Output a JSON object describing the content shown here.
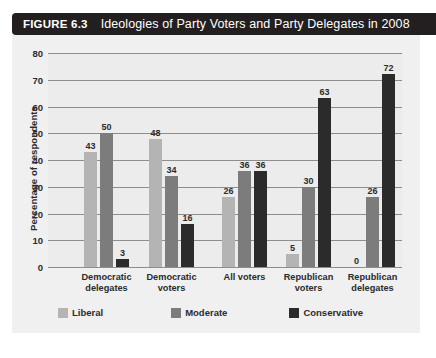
{
  "figure": {
    "number_label": "FIGURE 6.3",
    "title": "Ideologies of Party Voters and Party Delegates in 2008"
  },
  "colors": {
    "liberal": "#b4b4b4",
    "moderate": "#7c7c7c",
    "conservative": "#2b2b2b",
    "title_bar": "#231f20",
    "plot_background": "#ececec",
    "card_background": "#f0f0f0",
    "gridline": "#8d8d8d",
    "text": "#2b2b2b"
  },
  "chart_data": {
    "type": "bar",
    "title": "Ideologies of Party Voters and Party Delegates in 2008",
    "xlabel": "",
    "ylabel": "Percentage of respondents",
    "ylim": [
      0,
      80
    ],
    "yticks": [
      0,
      10,
      20,
      30,
      40,
      50,
      60,
      70,
      80
    ],
    "ytick_labels": [
      "0",
      "10",
      "20",
      "30",
      "40",
      "50",
      "60",
      "70",
      "80"
    ],
    "grid": true,
    "legend_position": "bottom",
    "categories": [
      "Democratic\ndelegates",
      "Democratic\nvoters",
      "All voters",
      "Republican\nvoters",
      "Republican\ndelegates"
    ],
    "series": [
      {
        "name": "Liberal",
        "color": "#b4b4b4",
        "values": [
          43,
          48,
          26,
          5,
          0
        ]
      },
      {
        "name": "Moderate",
        "color": "#7c7c7c",
        "values": [
          50,
          34,
          36,
          30,
          26
        ]
      },
      {
        "name": "Conservative",
        "color": "#2b2b2b",
        "values": [
          3,
          16,
          36,
          63,
          72
        ]
      }
    ],
    "data_labels": [
      {
        "group": "Democratic delegates",
        "Liberal": "43",
        "Moderate": "50",
        "Conservative": "3"
      },
      {
        "group": "Democratic voters",
        "Liberal": "48",
        "Moderate": "34",
        "Conservative": "16"
      },
      {
        "group": "All voters",
        "Liberal": "26",
        "Moderate": "36",
        "Conservative": "36"
      },
      {
        "group": "Republican voters",
        "Liberal": "5",
        "Moderate": "30",
        "Conservative": "63"
      },
      {
        "group": "Republican delegates",
        "Liberal": "0",
        "Moderate": "26",
        "Conservative": "72"
      }
    ]
  },
  "legend": {
    "items": [
      {
        "label": "Liberal"
      },
      {
        "label": "Moderate"
      },
      {
        "label": "Conservative"
      }
    ]
  }
}
